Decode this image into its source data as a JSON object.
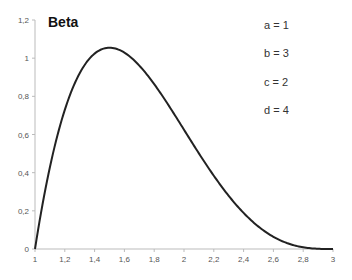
{
  "chart_data": {
    "type": "line",
    "title": "Beta",
    "xlabel": "",
    "ylabel": "",
    "xlim": [
      1,
      3
    ],
    "ylim": [
      0,
      1.2
    ],
    "grid": false,
    "x_ticks": [
      "1",
      "1,2",
      "1,4",
      "1,6",
      "1,8",
      "2",
      "2,2",
      "2,4",
      "2,6",
      "2,8",
      "3"
    ],
    "y_ticks": [
      "0",
      "0,2",
      "0,4",
      "0,6",
      "0,8",
      "1",
      "1,2"
    ],
    "annotations": [
      "a = 1",
      "b = 3",
      "c = 2",
      "d = 4"
    ],
    "series": [
      {
        "name": "Beta pdf",
        "color": "#222222",
        "x": [
          1.0,
          1.1,
          1.2,
          1.3,
          1.4,
          1.5,
          1.6,
          1.7,
          1.8,
          1.9,
          2.0,
          2.1,
          2.2,
          2.3,
          2.4,
          2.5,
          2.6,
          2.7,
          2.8,
          2.9,
          3.0
        ],
        "values": [
          0.0,
          0.429,
          0.729,
          0.921,
          1.024,
          1.055,
          1.029,
          0.96,
          0.864,
          0.749,
          0.625,
          0.5,
          0.384,
          0.281,
          0.192,
          0.125,
          0.072,
          0.035,
          0.013,
          0.002,
          0.0
        ]
      }
    ]
  }
}
